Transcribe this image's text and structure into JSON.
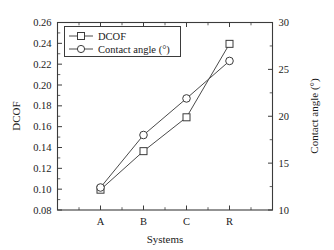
{
  "chart_data": {
    "type": "line",
    "title": "",
    "xlabel": "Systems",
    "ylabel": "DCOF",
    "y2label": "Contact angle (°)",
    "categories": [
      "A",
      "B",
      "C",
      "R"
    ],
    "ylim": [
      0.08,
      0.26
    ],
    "y2lim": [
      10,
      30
    ],
    "yticks": [
      "0.08",
      "0.10",
      "0.12",
      "0.14",
      "0.16",
      "0.18",
      "0.20",
      "0.22",
      "0.24",
      "0.26"
    ],
    "ytick_values": [
      0.08,
      0.1,
      0.12,
      0.14,
      0.16,
      0.18,
      0.2,
      0.22,
      0.24,
      0.26
    ],
    "y2ticks": [
      "10",
      "15",
      "20",
      "25",
      "30"
    ],
    "y2tick_values": [
      10,
      15,
      20,
      25,
      30
    ],
    "grid": false,
    "legend_position": "upper left",
    "series": [
      {
        "name": "DCOF",
        "axis": "left",
        "marker": "square",
        "values": [
          0.0995,
          0.1365,
          0.169,
          0.2395
        ]
      },
      {
        "name": "Contact angle (°)",
        "axis": "right",
        "marker": "circle",
        "values": [
          12.4,
          18.0,
          21.9,
          25.9
        ]
      }
    ]
  },
  "legend": {
    "entries": [
      {
        "label": "DCOF",
        "marker": "square"
      },
      {
        "label": "Contact angle (°)",
        "marker": "circle"
      }
    ]
  },
  "axes": {
    "left_title": "DCOF",
    "right_title": "Contact angle (°)",
    "bottom_title": "Systems"
  },
  "colors": {
    "line": "#4a4a4a",
    "frame": "#3b3b3b",
    "marker_fill": "#ffffff",
    "text": "#1a1a1a",
    "background": "#ffffff"
  }
}
